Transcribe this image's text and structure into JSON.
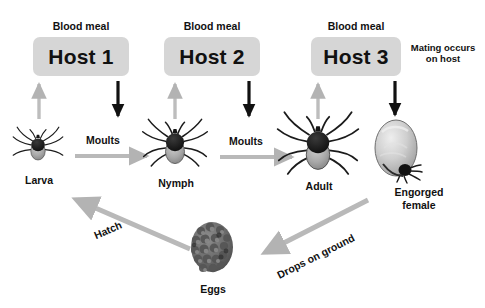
{
  "diagram": {
    "background": "#ffffff",
    "colors": {
      "host_box_fill": "#d6d6d6",
      "gray_arrow": "#b3b3b3",
      "black_arrow": "#111111",
      "text": "#111111"
    }
  },
  "hosts": [
    {
      "blood_meal": "Blood meal",
      "label": "Host 1"
    },
    {
      "blood_meal": "Blood meal",
      "label": "Host 2"
    },
    {
      "blood_meal": "Blood meal",
      "label": "Host 3"
    }
  ],
  "notes": {
    "mating_line1": "Mating occurs",
    "mating_line2": "on host"
  },
  "stages": [
    {
      "key": "larva",
      "label": "Larva",
      "icon": "tick-larva-icon"
    },
    {
      "key": "nymph",
      "label": "Nymph",
      "icon": "tick-nymph-icon"
    },
    {
      "key": "adult",
      "label": "Adult",
      "icon": "tick-adult-icon"
    },
    {
      "key": "engorged",
      "label_line1": "Engorged",
      "label_line2": "female",
      "icon": "engorged-female-tick-icon"
    },
    {
      "key": "eggs",
      "label": "Eggs",
      "icon": "tick-egg-mass-icon"
    }
  ],
  "transitions": [
    {
      "key": "moult1",
      "label": "Moults",
      "from": "larva",
      "to": "nymph"
    },
    {
      "key": "moult2",
      "label": "Moults",
      "from": "nymph",
      "to": "adult"
    },
    {
      "key": "drops",
      "label": "Drops on ground",
      "from": "engorged",
      "to": "eggs"
    },
    {
      "key": "hatch",
      "label": "Hatch",
      "from": "eggs",
      "to": "larva"
    }
  ]
}
